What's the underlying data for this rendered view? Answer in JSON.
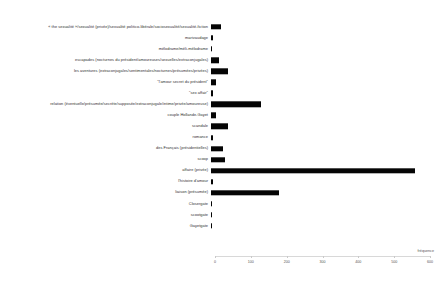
{
  "chart_data": {
    "type": "bar",
    "orientation": "horizontal",
    "title": "",
    "xlabel": "fréquence",
    "ylabel": "",
    "xlim": [
      0,
      600
    ],
    "xticks": [
      0,
      100,
      200,
      300,
      400,
      500,
      600
    ],
    "grid": false,
    "legend": false,
    "categories": [
      "« the sexualité »/sexualité (privée)/sexualité politico-libérale/sociosexualité/sexualité-fiction",
      "marivaudage",
      "mélodrame/méli-mélodrame",
      "escapades (nocturnes du président/amoureuses/sexuelles/extraconjugales)",
      "les aventures (extraconjugales/sentimentales/nocturnes/présumées/privées)",
      "\"l'amour secret du président\"",
      "\"sex affair\"",
      "relation (éventuelle/présumée/secrète/supposée/extraconjugale/intime/privée/amoureuse)",
      "couple Hollande-Gayet",
      "scandale",
      "romance",
      "des Français (présidentielles)",
      "scoop",
      "affaire (privée)",
      "l'histoire d'amour",
      "liaison (présumée)",
      "Closergate",
      "scootgate",
      "Gayetgate"
    ],
    "values": [
      28,
      6,
      4,
      22,
      47,
      13,
      6,
      140,
      13,
      48,
      6,
      33,
      40,
      570,
      6,
      190,
      3,
      3,
      4
    ]
  }
}
